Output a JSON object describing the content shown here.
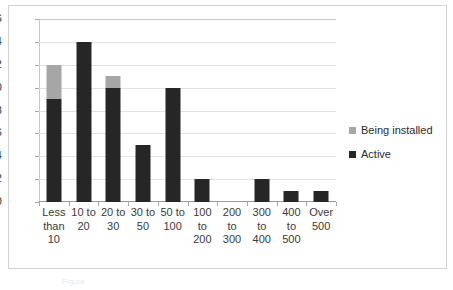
{
  "chart_data": {
    "type": "bar",
    "subtype": "stacked-column",
    "title": "",
    "xlabel": "",
    "ylabel": "",
    "ylim": [
      0,
      16
    ],
    "ytick_step": 2,
    "yticks": [
      16,
      14,
      12,
      10,
      8,
      6,
      4,
      2,
      0
    ],
    "grid": true,
    "grid_axis": "y",
    "legend_position": "right",
    "categories": [
      "Less than 10",
      "10 to 20",
      "20 to 30",
      "30 to 50",
      "50 to 100",
      "100 to 200",
      "200 to 300",
      "300 to 400",
      "400 to 500",
      "Over 500"
    ],
    "category_lines": [
      [
        "Less",
        "than",
        "10"
      ],
      [
        "10 to",
        "20"
      ],
      [
        "20 to",
        "30"
      ],
      [
        "30 to",
        "50"
      ],
      [
        "50 to",
        "100"
      ],
      [
        "100",
        "to",
        "200"
      ],
      [
        "200",
        "to",
        "300"
      ],
      [
        "300",
        "to",
        "400"
      ],
      [
        "400",
        "to",
        "500"
      ],
      [
        "Over",
        "500"
      ]
    ],
    "series": [
      {
        "name": "Active",
        "color": "#262626",
        "values": [
          9,
          14,
          10,
          5,
          10,
          2,
          0,
          2,
          1,
          1
        ]
      },
      {
        "name": "Being installed",
        "color": "#a6a6a6",
        "values": [
          3,
          0,
          1,
          0,
          0,
          0,
          0,
          0,
          0,
          0
        ]
      }
    ],
    "totals": [
      12,
      14,
      11,
      5,
      10,
      2,
      0,
      2,
      1,
      1
    ]
  },
  "legend": {
    "entries": [
      {
        "label": "Being installed",
        "color": "#a6a6a6"
      },
      {
        "label": "Active",
        "color": "#262626"
      }
    ]
  },
  "caption": {
    "text": "Figure"
  }
}
